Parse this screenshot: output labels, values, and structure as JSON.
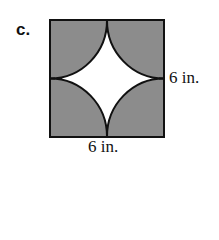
{
  "problem_label": "c.",
  "figure": {
    "side_right_label": "6 in.",
    "side_bottom_label": "6 in.",
    "colors": {
      "shade": "#8c8c8c",
      "stroke": "#111111",
      "background": "#ffffff"
    }
  }
}
